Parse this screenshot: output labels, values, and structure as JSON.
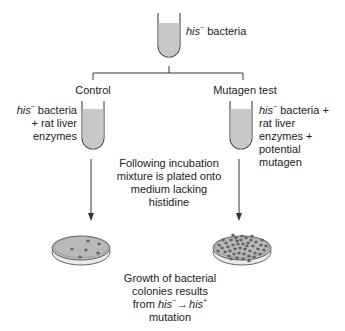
{
  "top": {
    "label_italic": "his",
    "label_sup": "−",
    "label_rest": " bacteria"
  },
  "control": {
    "title": "Control",
    "tube_label_italic": "his",
    "tube_label_sup": "−",
    "tube_label_line1_rest": " bacteria",
    "tube_label_line2": "+ rat liver",
    "tube_label_line3": "enzymes",
    "colony_count": 6
  },
  "mutagen": {
    "title": "Mutagen test",
    "tube_label_italic": "his",
    "tube_label_sup": "−",
    "tube_label_line1_rest": " bacteria +",
    "tube_label_line2": "rat liver",
    "tube_label_line3": "enzymes +",
    "tube_label_line4": "potential",
    "tube_label_line5": "mutagen",
    "colony_count": 45
  },
  "middle": {
    "line1": "Following incubation",
    "line2": "mixture is plated onto",
    "line3": "medium lacking",
    "line4": "histidine"
  },
  "bottom": {
    "line1": "Growth of bacterial",
    "line2": "colonies results",
    "line3_prefix": "from ",
    "line3_his1": "his",
    "line3_sup1": "−",
    "line3_arrow": "→",
    "line3_his2": "his",
    "line3_sup2": "+",
    "line4": "mutation"
  },
  "colors": {
    "line": "#333333",
    "tube_fill": "#c8c8c8",
    "plate_fill": "#b9b9b9",
    "colony": "#6e6e6e"
  }
}
